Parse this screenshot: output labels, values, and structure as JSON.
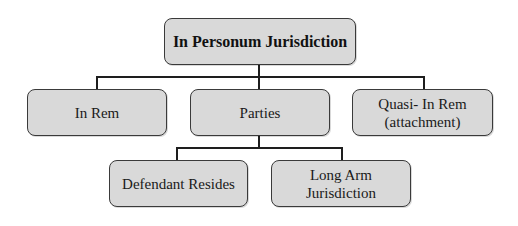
{
  "diagram": {
    "type": "hierarchy",
    "root": {
      "label": "In Personum Jurisdiction"
    },
    "level1": [
      {
        "label": "In Rem"
      },
      {
        "label": "Parties"
      },
      {
        "label_line1": "Quasi- In Rem",
        "label_line2": "(attachment)"
      }
    ],
    "level2": [
      {
        "label": "Defendant Resides"
      },
      {
        "label_line1": "Long Arm",
        "label_line2": "Jurisdiction"
      }
    ],
    "edges": [
      [
        "In Personum Jurisdiction",
        "In Rem"
      ],
      [
        "In Personum Jurisdiction",
        "Parties"
      ],
      [
        "In Personum Jurisdiction",
        "Quasi- In Rem (attachment)"
      ],
      [
        "Parties",
        "Defendant Resides"
      ],
      [
        "Parties",
        "Long Arm Jurisdiction"
      ]
    ],
    "colors": {
      "box_fill": "#d9d9d9",
      "box_border": "#3a3a3a",
      "connector": "#1e1e1e",
      "background": "#ffffff"
    }
  }
}
